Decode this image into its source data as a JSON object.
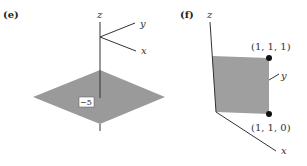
{
  "figure": {
    "panel_e": {
      "label": "(e)",
      "axes": {
        "z": "z",
        "y": "y",
        "x": "x"
      },
      "plane_label": "−5",
      "plane_color": "#9a9a9a"
    },
    "panel_f": {
      "label": "(f)",
      "axes": {
        "z": "z",
        "y": "y",
        "x": "x"
      },
      "points": [
        {
          "label": "(1, 1, 1)"
        },
        {
          "label": "(1, 1, 0)"
        }
      ],
      "plane_color": "#9f9f9f"
    }
  }
}
